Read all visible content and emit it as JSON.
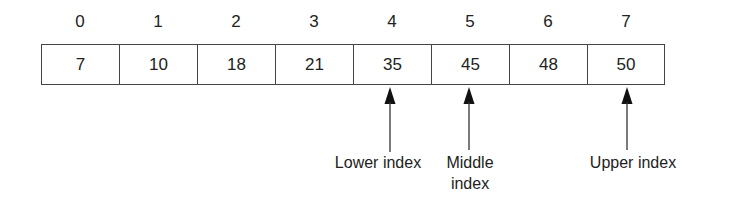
{
  "array": {
    "indices": [
      "0",
      "1",
      "2",
      "3",
      "4",
      "5",
      "6",
      "7"
    ],
    "values": [
      "7",
      "10",
      "18",
      "21",
      "35",
      "45",
      "48",
      "50"
    ]
  },
  "pointers": [
    {
      "label": "Lower index",
      "target_index": 4
    },
    {
      "label": "Middle\nindex",
      "line1": "Middle",
      "line2": "index",
      "target_index": 5
    },
    {
      "label": "Upper index",
      "target_index": 7
    }
  ]
}
